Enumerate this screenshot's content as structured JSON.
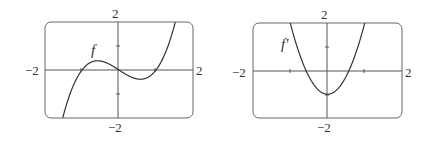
{
  "chart_data": [
    {
      "type": "line",
      "title": "",
      "function_label": "f",
      "formula": "x^3 - x",
      "xlim": [
        -2,
        2
      ],
      "ylim": [
        -2,
        2
      ],
      "tick_labels": {
        "x_min": "−2",
        "x_max": "2",
        "y_max": "2",
        "y_min": "−2"
      },
      "x": [
        -1.6,
        -1.2,
        -1.0,
        -0.577,
        0,
        0.577,
        1.0,
        1.2,
        1.6
      ],
      "values": [
        -2.496,
        -0.528,
        0,
        0.385,
        0,
        -0.385,
        0,
        0.528,
        2.496
      ],
      "grid": false
    },
    {
      "type": "line",
      "title": "",
      "function_label": "f′",
      "formula": "3x^2 - 1",
      "xlim": [
        -2,
        2
      ],
      "ylim": [
        -2,
        2
      ],
      "tick_labels": {
        "x_min": "−2",
        "x_max": "2",
        "y_max": "2",
        "y_min": "−2"
      },
      "x": [
        -1.0,
        -0.577,
        0,
        0.577,
        1.0
      ],
      "values": [
        2,
        0,
        -1,
        0,
        2
      ],
      "grid": false
    }
  ],
  "left": {
    "label": "f",
    "xmin": "−2",
    "xmax": "2",
    "ymax": "2",
    "ymin": "−2"
  },
  "right": {
    "label": "f′",
    "xmin": "−2",
    "xmax": "2",
    "ymax": "2",
    "ymin": "−2"
  }
}
